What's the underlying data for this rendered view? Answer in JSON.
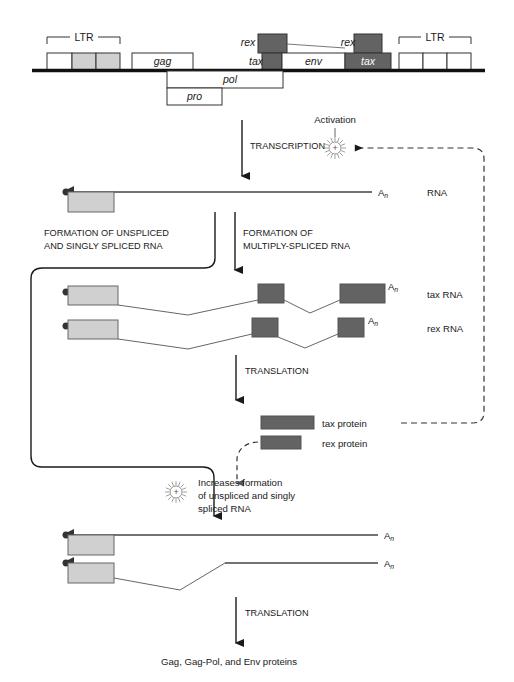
{
  "figure": {
    "colors": {
      "light_gray": "#d0d0d0",
      "dark_gray": "#636363",
      "white": "#ffffff",
      "stroke": "#333333",
      "genome_line": "#111111"
    }
  },
  "genome": {
    "left_ltr": {
      "label": "LTR",
      "segments": [
        "white",
        "light",
        "light"
      ]
    },
    "right_ltr": {
      "label": "LTR",
      "segments": [
        "white",
        "white",
        "white"
      ]
    },
    "genes": [
      {
        "name": "gag",
        "shade": "white"
      },
      {
        "name": "pol",
        "shade": "white"
      },
      {
        "name": "pro",
        "shade": "white"
      },
      {
        "name": "env",
        "shade": "white"
      },
      {
        "name": "rex",
        "shade": "dark"
      },
      {
        "name": "tax",
        "shade": "dark"
      },
      {
        "name": "rex",
        "shade": "dark"
      },
      {
        "name": "tax",
        "shade": "dark"
      }
    ],
    "labels": {
      "rex_left": "rex",
      "tax_left": "tax",
      "env": "env",
      "rex_right": "rex",
      "tax_right": "tax",
      "gag": "gag",
      "pol": "pol",
      "pro": "pro"
    }
  },
  "steps": {
    "transcription": "TRANSCRIPTION",
    "activation": "Activation",
    "formation_unspliced_line1": "FORMATION OF UNSPLICED",
    "formation_unspliced_line2": "AND SINGLY SPLICED RNA",
    "formation_multiply_line1": "FORMATION OF",
    "formation_multiply_line2": "MULTIPLY-SPLICED RNA",
    "translation_upper": "TRANSLATION",
    "translation_lower": "TRANSLATION",
    "increases_line1": "Increases formation",
    "increases_line2": "of unspliced and singly",
    "increases_line3": "spliced RNA",
    "final_products": "Gag, Gag-Pol, and Env proteins"
  },
  "transcripts": {
    "primary_rna": {
      "label": "RNA",
      "tail": "A",
      "tail_sub": "n"
    },
    "tax_rna": {
      "label": "tax RNA",
      "tail": "A",
      "tail_sub": "n"
    },
    "rex_rna": {
      "label": "rex RNA",
      "tail": "A",
      "tail_sub": "n"
    },
    "unspliced_rna": {
      "tail": "A",
      "tail_sub": "n"
    },
    "singly_spliced_rna": {
      "tail": "A",
      "tail_sub": "n"
    }
  },
  "proteins": [
    {
      "name": "tax protein",
      "shade": "dark"
    },
    {
      "name": "rex protein",
      "shade": "dark"
    }
  ],
  "icons": {
    "activation_burst": "sunburst-plus-icon",
    "rex_burst": "sunburst-plus-icon",
    "cap": "rna-cap-icon"
  }
}
